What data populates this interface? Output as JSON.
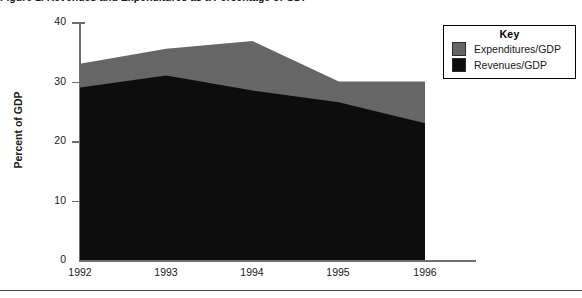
{
  "figure": {
    "title_cutoff": "Figure 1.  Revenues and Expenditures as a Percentage of GDP",
    "footer_rule": true
  },
  "axes": {
    "y_title": "Percent of GDP",
    "y_ticks": [
      "40",
      "30",
      "20",
      "10",
      "0"
    ],
    "x_ticks": [
      "1992",
      "1993",
      "1994",
      "1995",
      "1996"
    ]
  },
  "legend": {
    "title": "Key",
    "items": [
      {
        "label": "Expenditures/GDP",
        "color": "#666666",
        "icon": "color-swatch-icon"
      },
      {
        "label": "Revenues/GDP",
        "color": "#0d0d0d",
        "icon": "color-swatch-icon"
      }
    ]
  },
  "chart_data": {
    "type": "area",
    "title": "Revenues and Expenditures as a Percentage of GDP",
    "xlabel": "",
    "ylabel": "Percent of GDP",
    "categories": [
      "1992",
      "1993",
      "1994",
      "1995",
      "1996"
    ],
    "x": [
      1992,
      1993,
      1994,
      1995,
      1996
    ],
    "series": [
      {
        "name": "Expenditures/GDP",
        "color": "#666666",
        "values": [
          33.0,
          35.5,
          36.8,
          30.0,
          30.0
        ]
      },
      {
        "name": "Revenues/GDP",
        "color": "#0d0d0d",
        "values": [
          29.0,
          31.0,
          28.5,
          26.5,
          23.0
        ]
      }
    ],
    "ylim": [
      0,
      40
    ],
    "ytick_step": 10,
    "grid": false,
    "legend_position": "top-right",
    "stacked": false,
    "note": "Expenditures area drawn behind; Revenues area overlaid in black so the gray visible band is the deficit (Expenditures minus Revenues)."
  }
}
